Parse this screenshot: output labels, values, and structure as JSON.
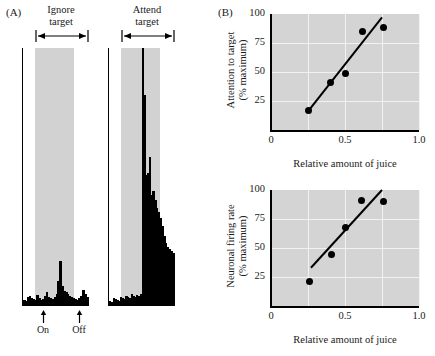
{
  "figure": {
    "panel_a": {
      "letter": "(A)",
      "histograms": [
        {
          "name": "ignore",
          "title_line1": "Ignore",
          "title_line2": "target",
          "stimulus_marker": "double-headed-arrow",
          "bars": [
            6,
            5,
            9,
            10,
            8,
            7,
            6,
            11,
            8,
            6,
            7,
            10,
            14,
            9,
            8,
            7,
            9,
            12,
            24,
            44,
            20,
            15,
            14,
            12,
            10,
            9,
            8,
            7,
            6,
            8,
            10,
            16,
            12,
            9
          ]
        },
        {
          "name": "attend",
          "title_line1": "Attend",
          "title_line2": "target",
          "stimulus_marker": "double-headed-arrow",
          "bars": [
            5,
            4,
            8,
            7,
            6,
            5,
            9,
            8,
            7,
            10,
            9,
            8,
            12,
            10,
            9,
            11,
            10,
            12,
            252,
            206,
            128,
            130,
            146,
            108,
            112,
            104,
            96,
            92,
            86,
            78,
            68,
            62,
            58,
            56,
            54,
            52
          ]
        }
      ],
      "markers": [
        {
          "name": "on",
          "label": "On",
          "glyph": "arrow-up"
        },
        {
          "name": "off",
          "label": "Off",
          "glyph": "arrow-up"
        }
      ],
      "colors": {
        "bar": "#000000",
        "stimulus_band": "#d2d2d2",
        "axis": "#000000"
      }
    },
    "panel_b": {
      "letter": "(B)"
    }
  },
  "chart_data": [
    {
      "type": "scatter",
      "name": "attention-to-target",
      "title": "",
      "xlabel": "Relative amount of juice",
      "ylabel": "Attention to target\n(% maximum)",
      "ylabel_line1": "Attention to target",
      "ylabel_line2": "(% maximum)",
      "xlim": [
        0,
        1.0
      ],
      "ylim": [
        0,
        100
      ],
      "xticks": [
        0,
        0.5,
        1.0
      ],
      "xticklabels": [
        "0",
        "0.5",
        "1.0"
      ],
      "yticks": [
        25,
        50,
        75,
        100
      ],
      "yticklabels": [
        "25",
        "50",
        "75",
        "100"
      ],
      "grid": true,
      "legend": "none",
      "points": [
        {
          "x": 0.25,
          "y": 17
        },
        {
          "x": 0.4,
          "y": 41
        },
        {
          "x": 0.5,
          "y": 49
        },
        {
          "x": 0.62,
          "y": 85
        },
        {
          "x": 0.76,
          "y": 88
        }
      ],
      "fit_line": {
        "x0": 0.25,
        "y0": 16,
        "x1": 0.75,
        "y1": 97
      },
      "colors": {
        "plot_background": "#d4d4d4",
        "grid": "#f2f2f2",
        "marker": "#000000",
        "fit_line": "#000000"
      }
    },
    {
      "type": "scatter",
      "name": "neuronal-firing-rate",
      "title": "",
      "xlabel": "Relative amount of juice",
      "ylabel": "Neuronal firing rate\n(% maximum)",
      "ylabel_line1": "Neuronal firing rate",
      "ylabel_line2": "(% maximum)",
      "xlim": [
        0,
        1.0
      ],
      "ylim": [
        0,
        100
      ],
      "xticks": [
        0,
        0.5,
        1.0
      ],
      "xticklabels": [
        "0",
        "0.5",
        "1.0"
      ],
      "yticks": [
        25,
        50,
        75,
        100
      ],
      "yticklabels": [
        "25",
        "50",
        "75",
        "100"
      ],
      "grid": true,
      "legend": "none",
      "points": [
        {
          "x": 0.26,
          "y": 21
        },
        {
          "x": 0.41,
          "y": 44
        },
        {
          "x": 0.5,
          "y": 68
        },
        {
          "x": 0.61,
          "y": 91
        },
        {
          "x": 0.76,
          "y": 90
        }
      ],
      "fit_line": {
        "x0": 0.27,
        "y0": 33,
        "x1": 0.75,
        "y1": 100
      },
      "colors": {
        "plot_background": "#d4d4d4",
        "grid": "#f2f2f2",
        "marker": "#000000",
        "fit_line": "#000000"
      }
    }
  ]
}
